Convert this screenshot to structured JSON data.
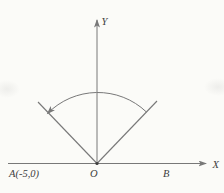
{
  "colors": {
    "background": "#fbfbf8",
    "line": "#787878",
    "text": "#3d3d3d"
  },
  "diagram": {
    "labels": {
      "y_axis": "Y",
      "x_axis": "X",
      "point_a": "A(-5,0)",
      "origin": "O",
      "point_b": "B"
    }
  }
}
